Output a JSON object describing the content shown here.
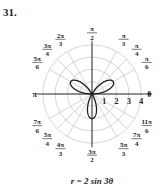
{
  "problem_number": "31.",
  "caption": "r = 2 sin 3θ",
  "chart_data": {
    "type": "polar",
    "title": "r = 2 sin 3θ",
    "equation": "r = 2 sin 3θ",
    "radial_ticks": [
      1,
      2,
      3,
      4
    ],
    "rlim": [
      0,
      4
    ],
    "grid": true,
    "angle_labels": [
      {
        "label": "0",
        "deg": 0
      },
      {
        "label": "π/6",
        "deg": 30
      },
      {
        "label": "π/4",
        "deg": 45
      },
      {
        "label": "π/3",
        "deg": 60
      },
      {
        "label": "π/2",
        "deg": 90
      },
      {
        "label": "2π/3",
        "deg": 120
      },
      {
        "label": "3π/4",
        "deg": 135
      },
      {
        "label": "5π/6",
        "deg": 150
      },
      {
        "label": "π",
        "deg": 180
      },
      {
        "label": "7π/6",
        "deg": 210
      },
      {
        "label": "5π/4",
        "deg": 225
      },
      {
        "label": "4π/3",
        "deg": 240
      },
      {
        "label": "3π/2",
        "deg": 270
      },
      {
        "label": "5π/3",
        "deg": 300
      },
      {
        "label": "7π/4",
        "deg": 315
      },
      {
        "label": "11π/6",
        "deg": 330
      }
    ],
    "curve": {
      "name": "three-petal rose",
      "a": 2,
      "n": 3,
      "petal_directions_deg": [
        30,
        150,
        270
      ],
      "petal_length": 2
    }
  }
}
